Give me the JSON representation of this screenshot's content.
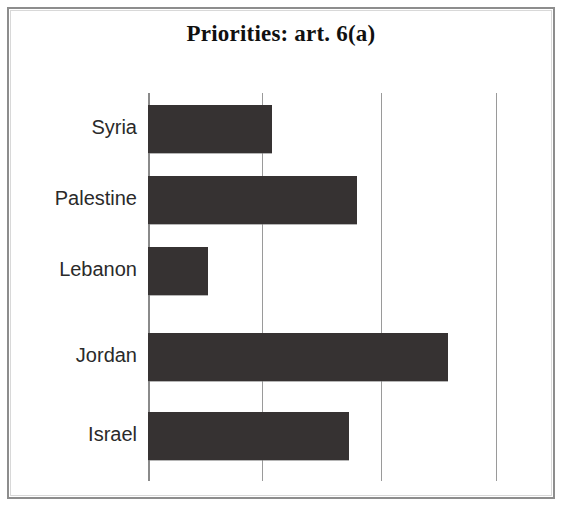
{
  "chart_data": {
    "type": "bar",
    "orientation": "horizontal",
    "title": "Priorities: art. 6(a)",
    "xlabel": "",
    "ylabel": "",
    "categories": [
      "Syria",
      "Palestine",
      "Lebanon",
      "Jordan",
      "Israel"
    ],
    "values": [
      1.07,
      1.8,
      0.52,
      2.59,
      1.73
    ],
    "series": [
      {
        "name": "Priorities: art. 6(a)",
        "values": [
          1.07,
          1.8,
          0.52,
          2.59,
          1.73
        ]
      }
    ],
    "xlim": [
      0,
      3
    ],
    "xticks": [
      0,
      1,
      2,
      3
    ],
    "xtick_labels": [
      "",
      "",
      "",
      ""
    ],
    "grid": true,
    "grid_axis": "x",
    "legend": false,
    "bar_color": "#363232",
    "gridline_color": "#9a9a9a",
    "axis_color": "#8a8a8a",
    "background_color": "#ffffff",
    "frame_color": "#8d8d8d",
    "bars": [
      {
        "category": "Syria",
        "value": 1.07,
        "pixel_length": 124,
        "row_top": 12,
        "row_height": 48
      },
      {
        "category": "Palestine",
        "value": 1.8,
        "pixel_length": 209,
        "row_top": 83,
        "row_height": 48
      },
      {
        "category": "Lebanon",
        "value": 0.52,
        "pixel_length": 60,
        "row_top": 154,
        "row_height": 48
      },
      {
        "category": "Jordan",
        "value": 2.59,
        "pixel_length": 300,
        "row_top": 240,
        "row_height": 48
      },
      {
        "category": "Israel",
        "value": 1.73,
        "pixel_length": 201,
        "row_top": 319,
        "row_height": 48
      }
    ],
    "gridlines_px": [
      0,
      114,
      233,
      348
    ]
  }
}
